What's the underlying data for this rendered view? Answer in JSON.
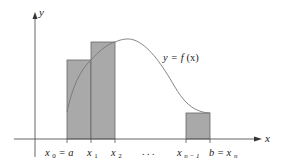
{
  "figure": {
    "colors": {
      "axis": "#555555",
      "curve": "#777777",
      "rect_fill": "#a9a9a9",
      "rect_stroke": "#666666",
      "text": "#222222"
    },
    "axes": {
      "x_label": "x",
      "y_label": "y"
    },
    "curve_label": {
      "y": "y",
      "eq": "=",
      "f": "f",
      "x": "(x)"
    },
    "tick_labels": [
      {
        "id": "x0",
        "main": "x",
        "sub": "0",
        "suffix": " = a"
      },
      {
        "id": "x1",
        "main": "x",
        "sub": "1",
        "suffix": ""
      },
      {
        "id": "x2",
        "main": "x",
        "sub": "2",
        "suffix": ""
      },
      {
        "id": "dots",
        "main": ". . .",
        "sub": "",
        "suffix": ""
      },
      {
        "id": "xn1",
        "main": "x",
        "sub": "n − 1",
        "suffix": ""
      },
      {
        "id": "xn",
        "prefix": "b = ",
        "main": "x",
        "sub": "n",
        "suffix": ""
      }
    ],
    "rectangles": [
      {
        "x_start": "x0",
        "x_end": "x1",
        "height_at": "left endpoint"
      },
      {
        "x_start": "x1",
        "x_end": "x2",
        "height_at": "left endpoint"
      },
      {
        "x_start": "xn-1",
        "x_end": "xn",
        "height_at": "left endpoint"
      }
    ]
  }
}
